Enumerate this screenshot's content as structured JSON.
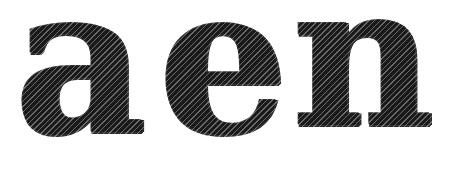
{
  "captcha": {
    "text": "aen",
    "glyphs": [
      "a",
      "e",
      "n"
    ],
    "ink_color": "#1a1a1a",
    "background_color": "#ffffff"
  }
}
